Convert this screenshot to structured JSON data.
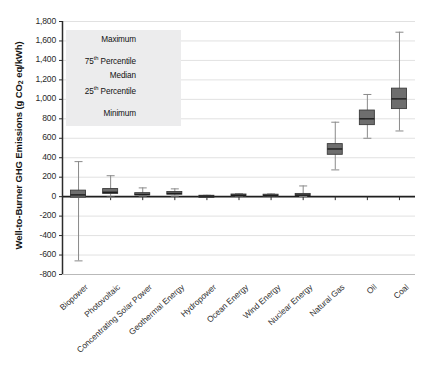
{
  "chart_data": {
    "type": "box",
    "title": "",
    "xlabel": "",
    "ylabel": "Well-to-Burner GHG Emissions (g CO2 eq/kWh)",
    "ylabel_parts": {
      "pre": "Well-to-Burner GHG Emissions (g CO",
      "sub": "2",
      "post": " eq/kWh)"
    },
    "ylim": [
      -800,
      1800
    ],
    "ytick_step": 200,
    "ytick_labels": [
      "1,800",
      "1,600",
      "1,400",
      "1,200",
      "1,000",
      "800",
      "600",
      "400",
      "200",
      "0",
      "-200",
      "-400",
      "-600",
      "-800"
    ],
    "ytick_values": [
      1800,
      1600,
      1400,
      1200,
      1000,
      800,
      600,
      400,
      200,
      0,
      -200,
      -400,
      -600,
      -800
    ],
    "grid": true,
    "legend_position": "inside-upper-left",
    "categories": [
      "Biopower",
      "Photovoltaic",
      "Concentrating Solar Power",
      "Geothermal Energy",
      "Hydropower",
      "Ocean Energy",
      "Wind Energy",
      "Nuclear Energy",
      "Natural Gas",
      "Oil",
      "Coal"
    ],
    "boxes": [
      {
        "name": "Biopower",
        "min": -660,
        "q1": -10,
        "median": 18,
        "q3": 62,
        "max": 360
      },
      {
        "name": "Photovoltaic",
        "min": -5,
        "q1": 28,
        "median": 45,
        "q3": 78,
        "max": 215
      },
      {
        "name": "Concentrating Solar Power",
        "min": 7,
        "q1": 14,
        "median": 22,
        "q3": 36,
        "max": 90
      },
      {
        "name": "Geothermal Energy",
        "min": 6,
        "q1": 20,
        "median": 33,
        "q3": 48,
        "max": 80
      },
      {
        "name": "Hydropower",
        "min": 0,
        "q1": 3,
        "median": 5,
        "q3": 9,
        "max": 14
      },
      {
        "name": "Ocean Energy",
        "min": 2,
        "q1": 8,
        "median": 14,
        "q3": 22,
        "max": 30
      },
      {
        "name": "Wind Energy",
        "min": 2,
        "q1": 8,
        "median": 12,
        "q3": 20,
        "max": 28
      },
      {
        "name": "Nuclear Energy",
        "min": 2,
        "q1": 9,
        "median": 16,
        "q3": 28,
        "max": 110
      },
      {
        "name": "Natural Gas",
        "min": 275,
        "q1": 430,
        "median": 490,
        "q3": 540,
        "max": 765
      },
      {
        "name": "Oil",
        "min": 600,
        "q1": 735,
        "median": 800,
        "q3": 885,
        "max": 1050
      },
      {
        "name": "Coal",
        "min": 675,
        "q1": 900,
        "median": 1005,
        "q3": 1110,
        "max": 1690
      }
    ],
    "colors": {
      "box_fill": "#6e6e6e",
      "box_edge": "#3c3c3c",
      "median_line": "#1e1e1e",
      "whisker": "#8a8a8a",
      "grid": "#d9d9d9",
      "axis": "#2b2b2b",
      "legend_bg": "#ececed"
    }
  },
  "legend": {
    "title": "",
    "rows": [
      {
        "label": "Maximum",
        "label_pre": "Maximum",
        "sup": ""
      },
      {
        "label": "75th Percentile",
        "label_pre": "75",
        "sup": "th",
        "label_post": " Percentile"
      },
      {
        "label": "Median",
        "label_pre": "Median",
        "sup": ""
      },
      {
        "label": "25th Percentile",
        "label_pre": "25",
        "sup": "th",
        "label_post": " Percentile"
      },
      {
        "label": "Minimum",
        "label_pre": "Minimum",
        "sup": ""
      }
    ],
    "sample_box": {
      "min": 840,
      "q1": 1090,
      "median": 1235,
      "q3": 1400,
      "max": 1600
    }
  }
}
